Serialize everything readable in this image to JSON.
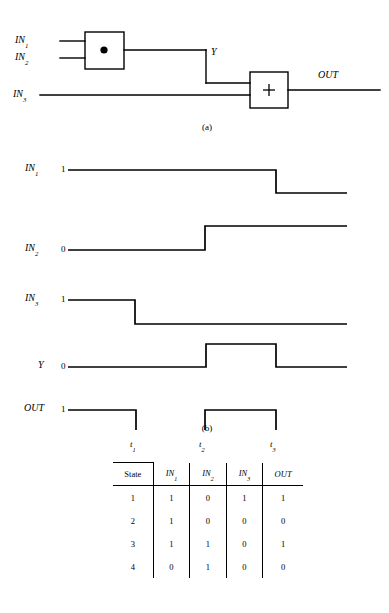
{
  "figure_a": {
    "caption": "(a)",
    "inputs": [
      {
        "name": "IN",
        "sub": "1"
      },
      {
        "name": "IN",
        "sub": "2"
      },
      {
        "name": "IN",
        "sub": "3"
      }
    ],
    "gates": [
      {
        "symbol": "●",
        "type": "and-gate"
      },
      {
        "symbol": "+",
        "type": "or-gate"
      }
    ],
    "internal_signal": "Y",
    "output": "OUT"
  },
  "figure_b": {
    "caption": "(b)",
    "waveforms": [
      {
        "label": "IN",
        "sub": "1",
        "level_marker": "1",
        "initial": 1,
        "transitions": [
          {
            "t": 276,
            "to": 0
          }
        ]
      },
      {
        "label": "IN",
        "sub": "2",
        "level_marker": "0",
        "initial": 0,
        "transitions": [
          {
            "t": 205,
            "to": 1
          }
        ]
      },
      {
        "label": "IN",
        "sub": "3",
        "level_marker": "1",
        "initial": 1,
        "transitions": [
          {
            "t": 135,
            "to": 0
          }
        ]
      },
      {
        "label": "Y",
        "sub": "",
        "level_marker": "0",
        "initial": 0,
        "transitions": [
          {
            "t": 206,
            "to": 1
          },
          {
            "t": 276,
            "to": 0
          }
        ]
      },
      {
        "label": "OUT",
        "sub": "",
        "level_marker": "1",
        "initial": 1,
        "transitions": [
          {
            "t": 136,
            "to": 0
          },
          {
            "t": 205,
            "to": 1
          },
          {
            "t": 276,
            "to": 0
          }
        ]
      }
    ],
    "time_markers": [
      {
        "label": "t",
        "sub": "1"
      },
      {
        "label": "t",
        "sub": "2"
      },
      {
        "label": "t",
        "sub": "3"
      }
    ]
  },
  "table": {
    "headers": [
      {
        "text": "State",
        "style": "roman"
      },
      {
        "text": "IN",
        "sub": "1",
        "style": "italic"
      },
      {
        "text": "IN",
        "sub": "2",
        "style": "italic"
      },
      {
        "text": "IN",
        "sub": "3",
        "style": "italic"
      },
      {
        "text": "OUT",
        "sub": "",
        "style": "italic"
      }
    ],
    "rows": [
      {
        "state": "1",
        "in1": "1",
        "in2": "0",
        "in3": "1",
        "out": "1"
      },
      {
        "state": "2",
        "in1": "1",
        "in2": "0",
        "in3": "0",
        "out": "0"
      },
      {
        "state": "3",
        "in1": "1",
        "in2": "1",
        "in3": "0",
        "out": "1"
      },
      {
        "state": "4",
        "in1": "0",
        "in2": "1",
        "in3": "0",
        "out": "0"
      }
    ]
  },
  "colors": {
    "ink": "#000000",
    "paper": "#ffffff"
  }
}
